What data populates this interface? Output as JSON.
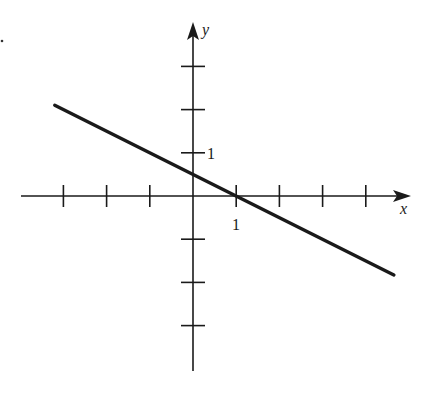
{
  "chart_data": {
    "type": "line",
    "title": "",
    "xlabel": "x",
    "ylabel": "y",
    "xlim": [
      -4,
      5
    ],
    "ylim": [
      -4,
      4
    ],
    "grid": false,
    "x_tick_labels": [
      {
        "value": 1,
        "label": "1"
      }
    ],
    "y_tick_labels": [
      {
        "value": 1,
        "label": "1"
      }
    ],
    "x_ticks": [
      -3,
      -2,
      -1,
      1,
      2,
      3,
      4
    ],
    "y_ticks": [
      -3,
      -2,
      -1,
      1,
      2,
      3
    ],
    "series": [
      {
        "name": "line",
        "equation": "y = -x/2 + 1/2",
        "x": [
          -3.2,
          4.65
        ],
        "y": [
          2.1,
          -1.83
        ]
      }
    ],
    "intercepts": {
      "y_intercept": 0.5,
      "x_intercept": 1
    }
  },
  "labels": {
    "x_axis": "x",
    "y_axis": "y",
    "x_tick_one": "1",
    "y_tick_one": "1",
    "marker_dot": "."
  },
  "colors": {
    "axis": "#1a1a1a",
    "line": "#1a1a1a",
    "background": "#ffffff"
  }
}
